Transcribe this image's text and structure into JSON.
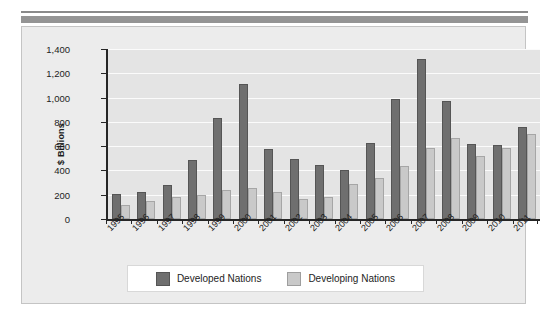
{
  "chart_data": {
    "type": "bar",
    "title": "",
    "xlabel": "",
    "ylabel": "$ Billions",
    "ylim": [
      0,
      1400
    ],
    "yticks": [
      0,
      200,
      400,
      600,
      800,
      1000,
      1200,
      1400
    ],
    "ytick_labels": [
      "0",
      "200",
      "400",
      "600",
      "800",
      "1,000",
      "1,200",
      "1,400"
    ],
    "grid": true,
    "legend_position": "bottom",
    "categories": [
      "1995",
      "1996",
      "1997",
      "1998",
      "1999",
      "2000",
      "2001",
      "2002",
      "2003",
      "2004",
      "2005",
      "2006",
      "2007",
      "2008",
      "2009",
      "2010",
      "2011"
    ],
    "series": [
      {
        "name": "Developed Nations",
        "color": "#6f6f6f",
        "values": [
          205,
          222,
          278,
          485,
          835,
          1110,
          575,
          495,
          448,
          400,
          630,
          985,
          1315,
          972,
          615,
          607,
          760
        ]
      },
      {
        "name": "Developing Nations",
        "color": "#c9c9c9",
        "values": [
          118,
          145,
          180,
          198,
          238,
          252,
          222,
          165,
          180,
          285,
          338,
          435,
          585,
          668,
          515,
          585,
          697
        ]
      }
    ]
  },
  "axis": {
    "y_title": "$ Billions"
  },
  "legend": {
    "items": [
      {
        "label": "Developed Nations",
        "swatch": "developed"
      },
      {
        "label": "Developing Nations",
        "swatch": "developing"
      }
    ]
  }
}
